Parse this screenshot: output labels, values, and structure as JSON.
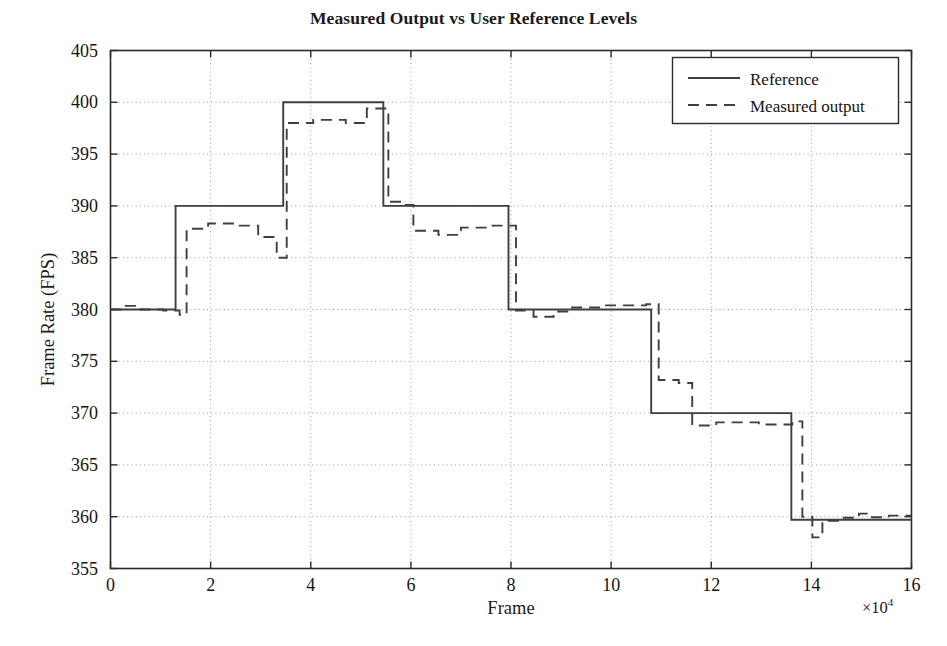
{
  "chart_data": {
    "type": "line",
    "title": "Measured Output vs User Reference Levels",
    "xlabel": "Frame",
    "ylabel": "Frame Rate (FPS)",
    "x_exponent_label": "×10⁴",
    "x_exponent_base": "×10",
    "x_exponent_power": "4",
    "xlim": [
      0,
      16
    ],
    "ylim": [
      355,
      405
    ],
    "x_scale_factor": 10000,
    "xticks": [
      0,
      2,
      4,
      6,
      8,
      10,
      12,
      14,
      16
    ],
    "xtick_labels": [
      "0",
      "2",
      "4",
      "6",
      "8",
      "10",
      "12",
      "14",
      "16"
    ],
    "yticks": [
      355,
      360,
      365,
      370,
      375,
      380,
      385,
      390,
      395,
      400,
      405
    ],
    "ytick_labels": [
      "355",
      "360",
      "365",
      "370",
      "375",
      "380",
      "385",
      "390",
      "395",
      "400",
      "405"
    ],
    "grid": true,
    "grid_style": "dotted",
    "legend_position": "top-right",
    "line_color": "#3f3f3f",
    "series": [
      {
        "name": "Reference",
        "style": "solid",
        "step_levels": [
          {
            "x_start": 0.0,
            "x_end": 1.3,
            "y": 380
          },
          {
            "x_start": 1.3,
            "x_end": 3.45,
            "y": 390
          },
          {
            "x_start": 3.45,
            "x_end": 5.45,
            "y": 400
          },
          {
            "x_start": 5.45,
            "x_end": 7.95,
            "y": 390
          },
          {
            "x_start": 7.95,
            "x_end": 10.8,
            "y": 380
          },
          {
            "x_start": 10.8,
            "x_end": 13.6,
            "y": 370
          },
          {
            "x_start": 13.6,
            "x_end": 16.0,
            "y": 359.7
          }
        ],
        "points": [
          [
            0.0,
            380
          ],
          [
            1.3,
            380
          ],
          [
            1.3,
            390
          ],
          [
            3.45,
            390
          ],
          [
            3.45,
            400
          ],
          [
            5.45,
            400
          ],
          [
            5.45,
            390
          ],
          [
            7.95,
            390
          ],
          [
            7.95,
            380
          ],
          [
            10.8,
            380
          ],
          [
            10.8,
            370
          ],
          [
            13.6,
            370
          ],
          [
            13.6,
            359.7
          ],
          [
            16.0,
            359.7
          ]
        ]
      },
      {
        "name": "Measured output",
        "style": "dashed",
        "points": [
          [
            0.0,
            380.0
          ],
          [
            0.25,
            380.0
          ],
          [
            0.25,
            380.35
          ],
          [
            0.6,
            380.35
          ],
          [
            0.6,
            380.0
          ],
          [
            1.05,
            380.0
          ],
          [
            1.05,
            379.9
          ],
          [
            1.38,
            379.9
          ],
          [
            1.38,
            379.5
          ],
          [
            1.52,
            379.5
          ],
          [
            1.52,
            387.8
          ],
          [
            1.95,
            387.8
          ],
          [
            1.95,
            388.3
          ],
          [
            2.55,
            388.3
          ],
          [
            2.55,
            388.1
          ],
          [
            2.95,
            388.1
          ],
          [
            2.95,
            387.0
          ],
          [
            3.32,
            387.0
          ],
          [
            3.32,
            385.0
          ],
          [
            3.52,
            385.0
          ],
          [
            3.52,
            398.0
          ],
          [
            4.05,
            398.0
          ],
          [
            4.05,
            398.3
          ],
          [
            4.7,
            398.3
          ],
          [
            4.7,
            398.0
          ],
          [
            5.12,
            398.0
          ],
          [
            5.12,
            399.4
          ],
          [
            5.55,
            399.4
          ],
          [
            5.55,
            390.4
          ],
          [
            5.9,
            390.4
          ],
          [
            5.9,
            390.1
          ],
          [
            6.05,
            390.1
          ],
          [
            6.05,
            387.6
          ],
          [
            6.55,
            387.6
          ],
          [
            6.55,
            387.2
          ],
          [
            7.0,
            387.2
          ],
          [
            7.0,
            387.9
          ],
          [
            7.55,
            387.9
          ],
          [
            7.55,
            388.1
          ],
          [
            8.1,
            388.1
          ],
          [
            8.1,
            379.9
          ],
          [
            8.45,
            379.9
          ],
          [
            8.45,
            379.3
          ],
          [
            8.85,
            379.3
          ],
          [
            8.85,
            379.8
          ],
          [
            9.2,
            379.8
          ],
          [
            9.2,
            380.2
          ],
          [
            9.8,
            380.2
          ],
          [
            9.8,
            380.4
          ],
          [
            10.7,
            380.4
          ],
          [
            10.7,
            380.5
          ],
          [
            10.95,
            380.5
          ],
          [
            10.95,
            373.2
          ],
          [
            11.35,
            373.2
          ],
          [
            11.35,
            372.9
          ],
          [
            11.62,
            372.9
          ],
          [
            11.62,
            368.8
          ],
          [
            12.1,
            368.8
          ],
          [
            12.1,
            369.1
          ],
          [
            12.95,
            369.1
          ],
          [
            12.95,
            368.9
          ],
          [
            13.62,
            368.9
          ],
          [
            13.62,
            369.2
          ],
          [
            13.82,
            369.2
          ],
          [
            13.82,
            360.0
          ],
          [
            14.02,
            360.0
          ],
          [
            14.02,
            358.0
          ],
          [
            14.22,
            358.0
          ],
          [
            14.22,
            359.6
          ],
          [
            14.55,
            359.6
          ],
          [
            14.55,
            359.9
          ],
          [
            14.95,
            359.9
          ],
          [
            14.95,
            360.3
          ],
          [
            15.15,
            360.3
          ],
          [
            15.15,
            359.95
          ],
          [
            15.55,
            359.95
          ],
          [
            15.55,
            360.1
          ],
          [
            16.0,
            360.1
          ]
        ]
      }
    ]
  },
  "legend": {
    "items": [
      {
        "label": "Reference",
        "style": "solid"
      },
      {
        "label": "Measured output",
        "style": "dashed"
      }
    ]
  }
}
